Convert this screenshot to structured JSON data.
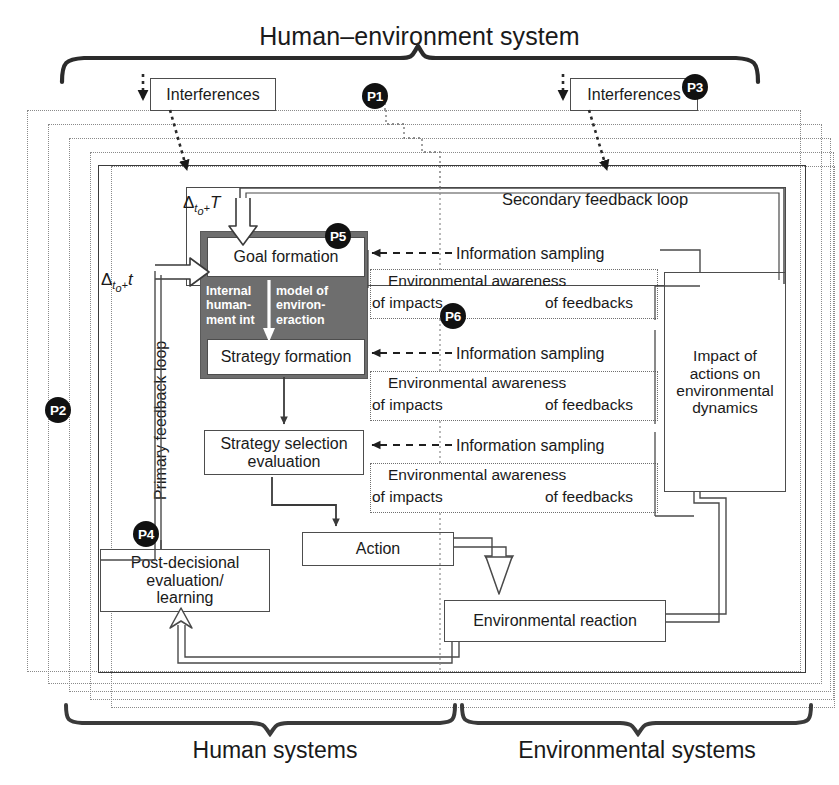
{
  "titles": {
    "main": "Human–environment system",
    "human_systems": "Human systems",
    "environmental_systems": "Environmental systems"
  },
  "markers": {
    "p1": "P1",
    "p2": "P2",
    "p3": "P3",
    "p4": "P4",
    "p5": "P5",
    "p6": "P6"
  },
  "boxes": {
    "interferences_left": "Interferences",
    "interferences_right": "Interferences",
    "goal_formation": "Goal formation",
    "strategy_formation": "Strategy formation",
    "strategy_selection": "Strategy selection\nevaluation",
    "action": "Action",
    "post_decisional": "Post-decisional\nevaluation/\nlearning",
    "environmental_reaction": "Environmental reaction",
    "impact_of_actions": "Impact of\nactions on\nenvironmental\ndynamics"
  },
  "internal_model": {
    "col_left": "Internal\nhuman-\nment int",
    "col_right": "model of\nenviron-\neraction",
    "full_text": "Internal model of human-environment interaction"
  },
  "loops": {
    "primary": "Primary feedback loop",
    "secondary": "Secondary feedback loop"
  },
  "deltas": {
    "upper": "Δto+T",
    "lower": "Δto+t",
    "upper_parts": {
      "sym": "Δ",
      "sub": "to+",
      "var": "T"
    },
    "lower_parts": {
      "sym": "Δ",
      "sub": "to+",
      "var": "t"
    }
  },
  "sampling": {
    "info_1": "Information sampling",
    "info_2": "Information sampling",
    "info_3": "Information sampling"
  },
  "awareness": [
    {
      "line1": "Environmental awareness",
      "impacts": "of impacts",
      "feedbacks": "of feedbacks"
    },
    {
      "line1": "Environmental awareness",
      "impacts": "of impacts",
      "feedbacks": "of feedbacks"
    },
    {
      "line1": "Environmental awareness",
      "impacts": "of impacts",
      "feedbacks": "of feedbacks"
    }
  ],
  "colors": {
    "ink": "#1a1a1a",
    "line": "#4d4d4d",
    "dotted": "#8a8a8a",
    "gray_block": "#6e6e6e",
    "marker_bg": "#111111",
    "marker_fg": "#ffffff",
    "page_bg": "#ffffff"
  }
}
